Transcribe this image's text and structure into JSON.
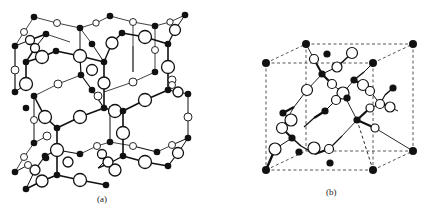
{
  "figures": [
    {
      "id": "a",
      "caption": "(a)",
      "description": "Hexagonal ice-like lattice of filled (dark) and open (white) spheres joined by bonds"
    },
    {
      "id": "b",
      "caption": "(b)",
      "description": "Cubic unit cell (dashed edges) containing diamond-type lattice of filled and open spheres"
    }
  ],
  "legend": {
    "filled_atom_color": "#111111",
    "open_atom_fill": "#ffffff",
    "bond_color": "#111111",
    "cell_edge_style": "dashed"
  }
}
